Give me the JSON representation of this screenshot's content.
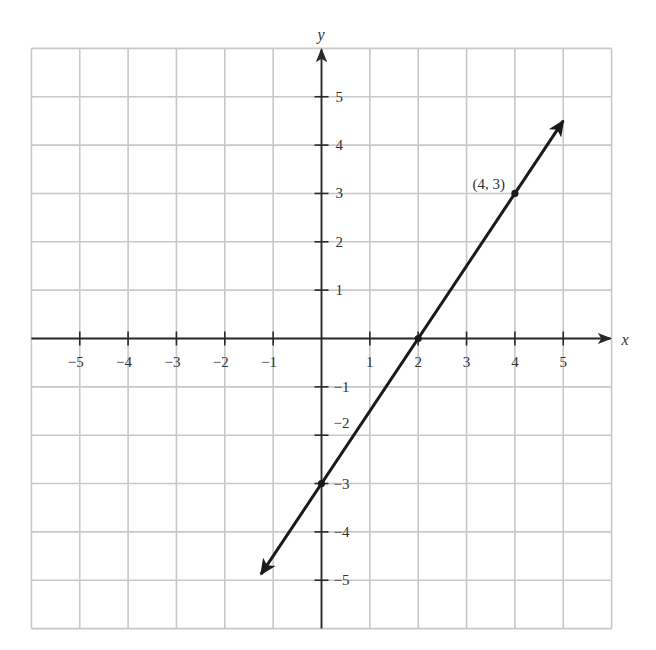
{
  "chart_data": {
    "type": "line",
    "title": "",
    "xlabel": "x",
    "ylabel": "y",
    "xlim": [
      -6,
      6
    ],
    "ylim": [
      -6,
      6
    ],
    "grid": true,
    "legend": null,
    "x_ticks": [
      -5,
      -4,
      -3,
      -2,
      -1,
      1,
      2,
      3,
      4,
      5
    ],
    "y_ticks": [
      -5,
      -4,
      -3,
      -2,
      -1,
      1,
      2,
      3,
      4,
      5
    ],
    "x_tick_labels": [
      "−5",
      "−4",
      "−3",
      "−2",
      "−1",
      "1",
      "2",
      "3",
      "4",
      "5"
    ],
    "y_tick_labels": [
      "−5",
      "−4",
      "−3",
      "−2",
      "−1",
      "1",
      "2",
      "3",
      "4",
      "5"
    ],
    "series": [
      {
        "name": "line",
        "equation": "y = 1.5x - 3",
        "slope": 1.5,
        "intercept": -3,
        "x_range": [
          -1.25,
          5.0
        ],
        "arrows": "both",
        "color": "#1a1a1a"
      }
    ],
    "points": [
      {
        "x": 0,
        "y": -3,
        "label": ""
      },
      {
        "x": 2,
        "y": 0,
        "label": ""
      },
      {
        "x": 4,
        "y": 3,
        "label": "(4, 3)"
      }
    ]
  },
  "colors": {
    "grid": "#c8c8c8",
    "axis": "#2a2a2a",
    "line": "#1a1a1a",
    "text": "#333333",
    "background": "#ffffff"
  }
}
